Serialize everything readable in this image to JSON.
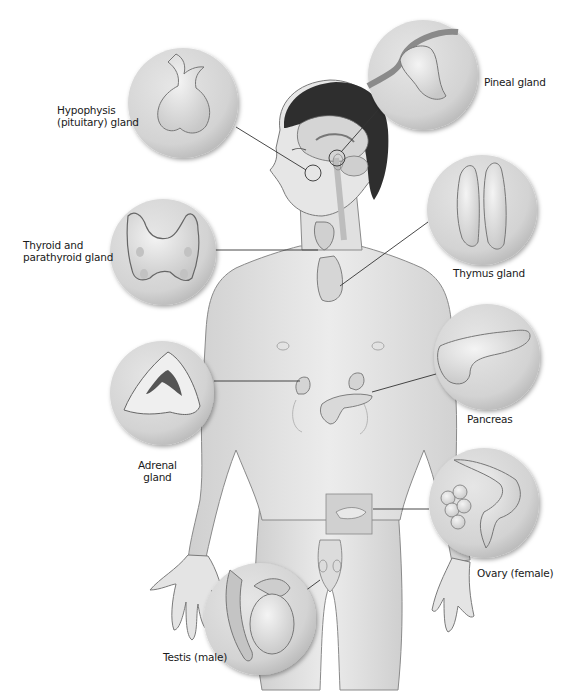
{
  "diagram": {
    "title": "",
    "labels": {
      "hypophysis_line1": "Hypophysis",
      "hypophysis_line2": "(pituitary) gland",
      "pineal": "Pineal gland",
      "thyroid_line1": "Thyroid and",
      "thyroid_line2": "parathyroid gland",
      "thymus": "Thymus gland",
      "pancreas": "Pancreas",
      "adrenal_line1": "Adrenal",
      "adrenal_line2": "gland",
      "ovary": "Ovary (female)",
      "testis": "Testis (male)"
    },
    "callouts": [
      {
        "name": "hypophysis",
        "cx": 183,
        "cy": 103,
        "r": 55
      },
      {
        "name": "pineal",
        "cx": 423,
        "cy": 75,
        "r": 55
      },
      {
        "name": "thyroid",
        "cx": 163,
        "cy": 252,
        "r": 53
      },
      {
        "name": "thymus",
        "cx": 482,
        "cy": 210,
        "r": 55
      },
      {
        "name": "pancreas",
        "cx": 487,
        "cy": 357,
        "r": 53
      },
      {
        "name": "adrenal",
        "cx": 162,
        "cy": 393,
        "r": 52
      },
      {
        "name": "ovary",
        "cx": 484,
        "cy": 503,
        "r": 55
      },
      {
        "name": "testis",
        "cx": 260,
        "cy": 619,
        "r": 56
      }
    ],
    "colors": {
      "background": "#ffffff",
      "callout_fill": "#d9d9d9",
      "skin": "#e2e2e2",
      "outline": "#6a6a6a",
      "hair": "#2e2e2e",
      "leader_line": "#333333",
      "text": "#1a1a1a"
    }
  }
}
